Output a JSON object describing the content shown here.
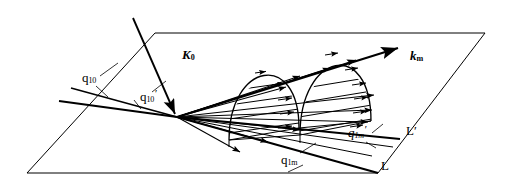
{
  "figure": {
    "background_color": "#ffffff",
    "stroke_color": "#000000"
  },
  "labels": {
    "incident_beam": {
      "symbol": "K",
      "subscript": "0",
      "name": "K-zero",
      "x": 182,
      "y": 55
    },
    "scattered_beam": {
      "symbol": "k",
      "subscript": "m",
      "name": "k-m",
      "x": 410,
      "y": 56
    },
    "q10": {
      "symbol": "q",
      "subscript": "10",
      "prime": "",
      "x": 82,
      "y": 78
    },
    "q10_prime": {
      "symbol": "q",
      "subscript": "10",
      "prime": "′",
      "x": 140,
      "y": 95
    },
    "q1m": {
      "symbol": "q",
      "subscript": "1m",
      "prime": "",
      "x": 281,
      "y": 160
    },
    "q1m_prime": {
      "symbol": "q",
      "subscript": "1m",
      "prime": "′",
      "x": 348,
      "y": 131
    },
    "line_L": {
      "text": "L",
      "x": 381,
      "y": 166
    },
    "line_L_prime": {
      "text": "L′",
      "x": 406,
      "y": 131
    }
  },
  "geometry": {
    "plane": {
      "name": "surface-plane",
      "corners": [
        [
          155,
          33
        ],
        [
          485,
          33
        ],
        [
          378,
          173
        ],
        [
          27,
          173
        ]
      ]
    },
    "origin": {
      "x": 177,
      "y": 117
    },
    "incident_ray": {
      "from": [
        133,
        18
      ],
      "to": [
        177,
        117
      ]
    },
    "main_scattered_ray": {
      "from": [
        177,
        117
      ],
      "to": [
        398,
        48
      ]
    },
    "fan_ray_count": 11,
    "dome_count": 2,
    "domes": [
      {
        "name": "first-rod-dome",
        "apex": [
          264,
          58
        ],
        "base_left": [
          229,
          140
        ],
        "base_right": [
          299,
          128
        ]
      },
      {
        "name": "second-rod-dome",
        "apex": [
          336,
          46
        ],
        "base_left": [
          300,
          135
        ],
        "base_right": [
          371,
          121
        ]
      }
    ],
    "laue_lines": [
      {
        "name": "laue-line-L",
        "from": [
          177,
          117
        ],
        "to": [
          378,
          173
        ]
      },
      {
        "name": "laue-line-L-prime",
        "from": [
          177,
          117
        ],
        "to": [
          400,
          140
        ]
      }
    ]
  }
}
